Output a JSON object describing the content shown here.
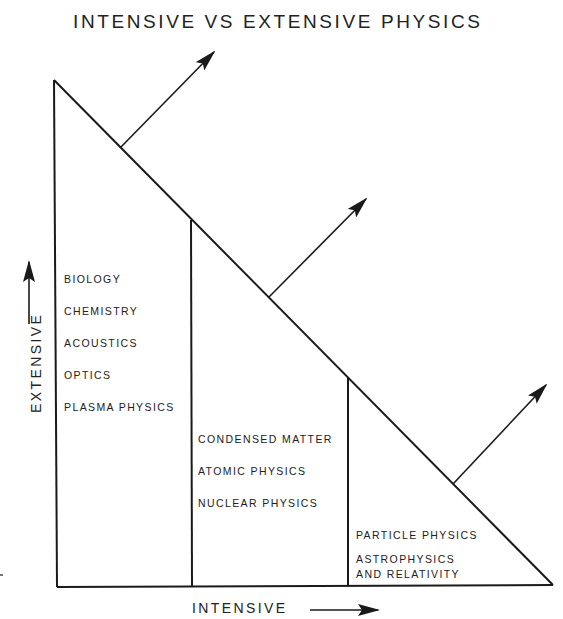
{
  "title": "INTENSIVE VS EXTENSIVE PHYSICS",
  "axes": {
    "x_label": "INTENSIVE",
    "y_label": "EXTENSIVE"
  },
  "regions": [
    {
      "name": "extensive-region",
      "items": [
        "BIOLOGY",
        "CHEMISTRY",
        "ACOUSTICS",
        "OPTICS",
        "PLASMA PHYSICS"
      ]
    },
    {
      "name": "middle-region",
      "items": [
        "CONDENSED MATTER",
        "ATOMIC PHYSICS",
        "NUCLEAR PHYSICS"
      ]
    },
    {
      "name": "intensive-region",
      "items": [
        "PARTICLE PHYSICS",
        "ASTROPHYSICS",
        "AND RELATIVITY"
      ]
    }
  ],
  "colors": {
    "ink": "#1a1a1a",
    "background": "#ffffff"
  }
}
